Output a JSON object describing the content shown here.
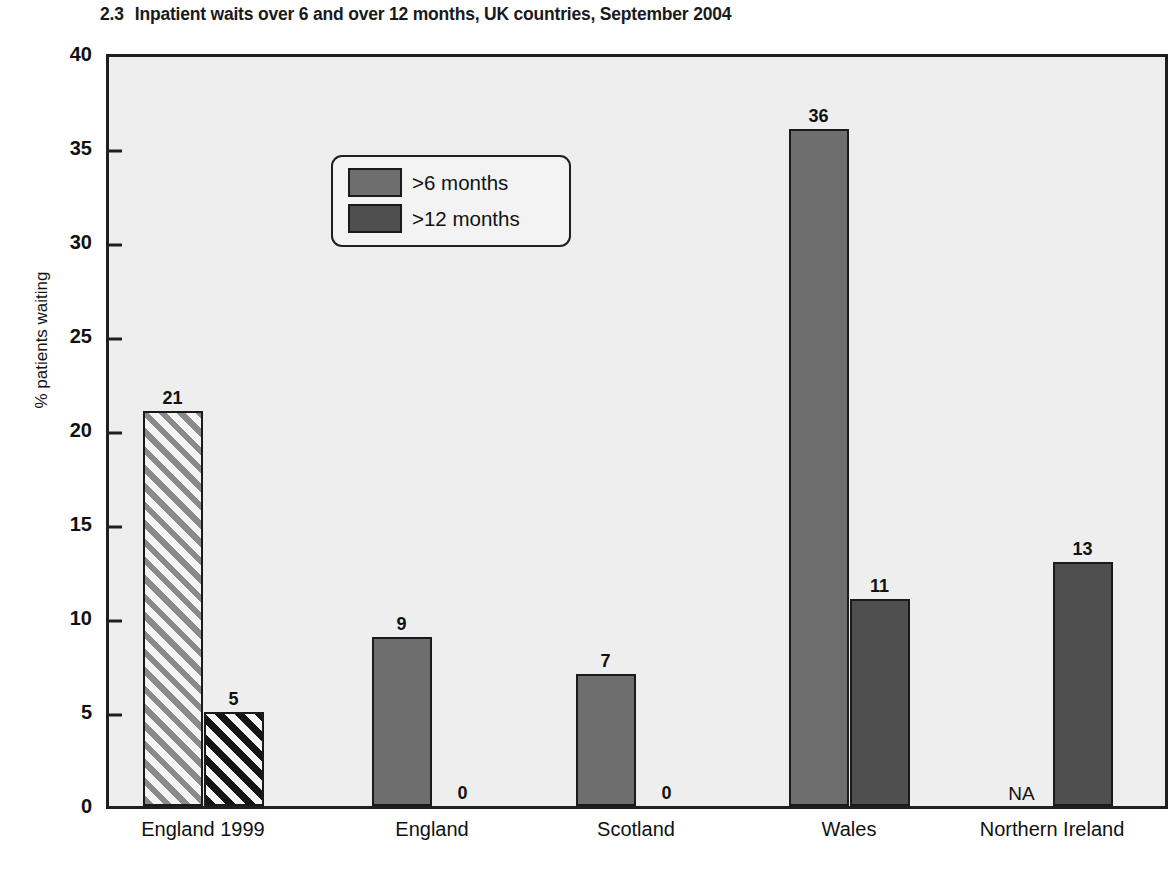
{
  "chart_data": {
    "type": "bar",
    "title": "Inpatient waits over 6 and over 12 months, UK countries, September 2004",
    "title_number": "2.3",
    "xlabel": "",
    "ylabel": "% patients waiting",
    "ylim": [
      0,
      40
    ],
    "yticks": [
      0,
      5,
      10,
      15,
      20,
      25,
      30,
      35,
      40
    ],
    "ytick_labels": [
      "0",
      "5",
      "10",
      "15",
      "20",
      "25",
      "30",
      "35",
      "40"
    ],
    "grid": false,
    "legend_position": "upper left",
    "categories": [
      "England 1999",
      "England",
      "Scotland",
      "Wales",
      "Northern Ireland"
    ],
    "series": [
      {
        "name": ">6 months",
        "values": [
          21,
          9,
          7,
          36,
          null
        ],
        "value_labels": [
          "21",
          "9",
          "7",
          "36",
          "NA"
        ],
        "color": "#6e6e6e"
      },
      {
        "name": ">12 months",
        "values": [
          5,
          0,
          0,
          11,
          13
        ],
        "value_labels": [
          "5",
          "0",
          "0",
          "11",
          "13"
        ],
        "color": "#4f4f4f"
      }
    ]
  },
  "legend": {
    "items": [
      {
        "label": ">6 months"
      },
      {
        "label": ">12 months"
      }
    ]
  },
  "colors": {
    "series_6_months": "#6e6e6e",
    "series_12_months": "#4f4f4f",
    "plot_background": "#eeeeee",
    "axis": "#1f1f1f"
  }
}
